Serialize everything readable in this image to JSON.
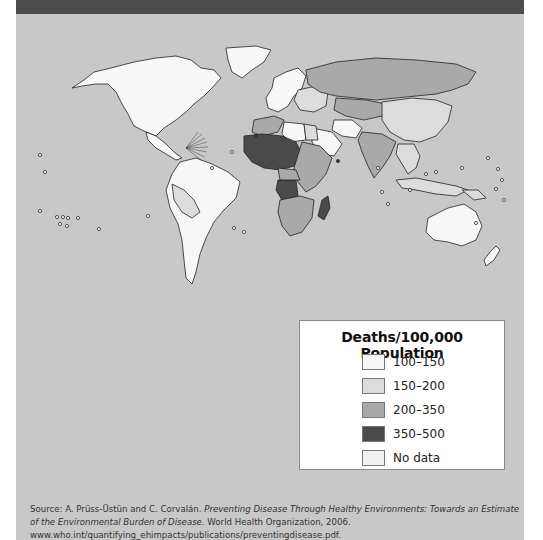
{
  "header": {
    "band_color": "#4d4d4d"
  },
  "panel": {
    "background": "#c8c8c8"
  },
  "map": {
    "subject": "World map of deaths per 100,000 population attributable to environmental burden of disease",
    "regions": [
      {
        "name": "North America",
        "class": "100-150"
      },
      {
        "name": "Greenland",
        "class": "100-150"
      },
      {
        "name": "South America",
        "class": "100-150"
      },
      {
        "name": "Western Europe",
        "class": "100-150"
      },
      {
        "name": "Australia",
        "class": "100-150"
      },
      {
        "name": "Russia",
        "class": "200-350"
      },
      {
        "name": "China",
        "class": "150-200"
      },
      {
        "name": "India",
        "class": "200-350"
      },
      {
        "name": "Saudi Arabia",
        "class": "100-150"
      },
      {
        "name": "West/Central Africa (Sahel)",
        "class": "350-500"
      },
      {
        "name": "Angola",
        "class": "350-500"
      },
      {
        "name": "Madagascar",
        "class": "350-500"
      },
      {
        "name": "East/Southern Africa",
        "class": "200-350"
      }
    ]
  },
  "legend": {
    "title": "Deaths/100,000 Population",
    "items": [
      {
        "label": "100–150",
        "color": "#f7f7f7"
      },
      {
        "label": "150–200",
        "color": "#dcdcdc"
      },
      {
        "label": "200–350",
        "color": "#a9a9a9"
      },
      {
        "label": "350–500",
        "color": "#4a4a4a"
      },
      {
        "label": "No data",
        "color": "#f0f0f0"
      }
    ]
  },
  "source": {
    "prefix": "Source: A. Prüss-Üstün and C. Corvalán. ",
    "title_italic": "Preventing Disease Through Healthy Environments: Towards an Estimate of the Environmental Burden of Disease.",
    "suffix": " World Health Organization, 2006. www.who.int/quantifying_ehimpacts/publications/preventingdisease.pdf."
  }
}
